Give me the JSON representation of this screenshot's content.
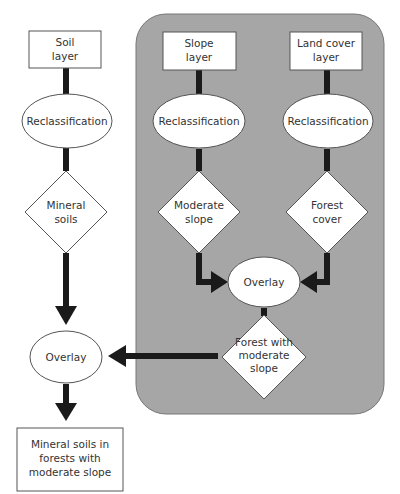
{
  "diagram": {
    "panel_color": "#a6a6a6",
    "connector_color": "#1a1a1a",
    "node_fill": "#ffffff",
    "nodes": {
      "soil_layer": {
        "type": "box",
        "lines": [
          "Soil",
          "layer"
        ]
      },
      "soil_reclass": {
        "type": "ellipse",
        "lines": [
          "Reclassification"
        ]
      },
      "mineral_soils": {
        "type": "diamond",
        "lines": [
          "Mineral",
          "soils"
        ]
      },
      "slope_layer": {
        "type": "box",
        "lines": [
          "Slope",
          "layer"
        ]
      },
      "slope_reclass": {
        "type": "ellipse",
        "lines": [
          "Reclassification"
        ]
      },
      "moderate_slope": {
        "type": "diamond",
        "lines": [
          "Moderate",
          "slope"
        ]
      },
      "landcover_layer": {
        "type": "box",
        "lines": [
          "Land cover",
          "layer"
        ]
      },
      "landcover_reclass": {
        "type": "ellipse",
        "lines": [
          "Reclassification"
        ]
      },
      "forest_cover": {
        "type": "diamond",
        "lines": [
          "Forest",
          "cover"
        ]
      },
      "center_overlay": {
        "type": "ellipse",
        "lines": [
          "Overlay"
        ]
      },
      "forest_moderate_slope": {
        "type": "diamond",
        "lines": [
          "Forest with",
          "moderate",
          "slope"
        ]
      },
      "left_overlay": {
        "type": "ellipse",
        "lines": [
          "Overlay"
        ]
      },
      "result": {
        "type": "box",
        "lines": [
          "Mineral soils in",
          "forests with",
          "moderate slope"
        ]
      }
    },
    "edges": [
      {
        "from": "soil_layer",
        "to": "soil_reclass",
        "arrow": false
      },
      {
        "from": "soil_reclass",
        "to": "mineral_soils",
        "arrow": false
      },
      {
        "from": "mineral_soils",
        "to": "left_overlay",
        "arrow": true
      },
      {
        "from": "slope_layer",
        "to": "slope_reclass",
        "arrow": false
      },
      {
        "from": "slope_reclass",
        "to": "moderate_slope",
        "arrow": false
      },
      {
        "from": "moderate_slope",
        "to": "center_overlay",
        "arrow": true
      },
      {
        "from": "landcover_layer",
        "to": "landcover_reclass",
        "arrow": false
      },
      {
        "from": "landcover_reclass",
        "to": "forest_cover",
        "arrow": false
      },
      {
        "from": "forest_cover",
        "to": "center_overlay",
        "arrow": true
      },
      {
        "from": "center_overlay",
        "to": "forest_moderate_slope",
        "arrow": false
      },
      {
        "from": "forest_moderate_slope",
        "to": "left_overlay",
        "arrow": true
      },
      {
        "from": "left_overlay",
        "to": "result",
        "arrow": true
      }
    ]
  }
}
